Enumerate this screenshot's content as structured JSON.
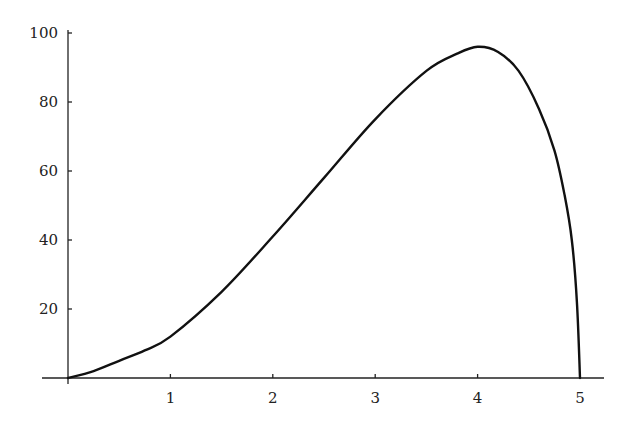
{
  "chart_data": {
    "type": "line",
    "title": "",
    "xlabel": "",
    "ylabel": "",
    "xlim": [
      0,
      5.2
    ],
    "ylim": [
      0,
      100
    ],
    "grid": false,
    "legend": null,
    "x_ticks": [
      "1",
      "2",
      "3",
      "4",
      "5"
    ],
    "y_ticks": [
      "20",
      "40",
      "60",
      "80",
      "100"
    ],
    "series": [
      {
        "name": "curve",
        "x": [
          0,
          0.25,
          0.5,
          0.75,
          1,
          1.5,
          2,
          2.5,
          3,
          3.5,
          3.8,
          4,
          4.2,
          4.4,
          4.6,
          4.75,
          4.85,
          4.92,
          4.97,
          5
        ],
        "y": [
          0,
          2,
          5,
          8,
          12,
          25,
          41,
          58,
          75,
          89,
          94,
          96,
          94.5,
          89,
          78,
          66,
          53,
          40,
          22,
          0
        ]
      }
    ]
  }
}
